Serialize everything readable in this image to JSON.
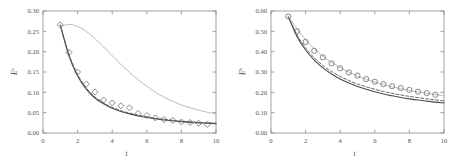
{
  "figure": {
    "background": "#ffffff",
    "panel_count": 2
  },
  "chart_data": [
    {
      "type": "line",
      "panel": "left",
      "title": "",
      "xlabel": "t",
      "ylabel": "E",
      "ylabel_superscript": "u",
      "xlim": [
        0,
        10
      ],
      "ylim": [
        0.0,
        0.3
      ],
      "xticks": [
        0,
        2,
        4,
        6,
        8,
        10
      ],
      "xticklabels": [
        "0",
        "2",
        "4",
        "6",
        "8",
        "10"
      ],
      "yticks": [
        0.0,
        0.05,
        0.1,
        0.15,
        0.2,
        0.25,
        0.3
      ],
      "yticklabels": [
        "0.00",
        "0.05",
        "0.10",
        "0.15",
        "0.20",
        "0.25",
        "0.30"
      ],
      "grid": false,
      "legend": "none",
      "x": [
        1.0,
        1.5,
        2.0,
        2.5,
        3.0,
        3.5,
        4.0,
        4.5,
        5.0,
        5.5,
        6.0,
        6.5,
        7.0,
        7.5,
        8.0,
        8.5,
        9.0,
        9.5,
        10.0
      ],
      "series": [
        {
          "name": "solid-dark-curve",
          "style": "solid",
          "color": "#4d4d4d",
          "width": 1.1,
          "values": [
            0.265,
            0.19,
            0.14,
            0.108,
            0.086,
            0.072,
            0.061,
            0.053,
            0.047,
            0.042,
            0.038,
            0.035,
            0.032,
            0.03,
            0.028,
            0.026,
            0.025,
            0.024,
            0.023
          ]
        },
        {
          "name": "dashed-curve",
          "style": "dashed",
          "color": "#555555",
          "width": 0.9,
          "values": [
            0.266,
            0.194,
            0.144,
            0.111,
            0.089,
            0.074,
            0.063,
            0.055,
            0.049,
            0.044,
            0.04,
            0.036,
            0.034,
            0.031,
            0.029,
            0.028,
            0.026,
            0.025,
            0.024
          ]
        },
        {
          "name": "light-gray-curve",
          "style": "solid",
          "color": "#b3b3b3",
          "width": 0.9,
          "values": [
            0.262,
            0.267,
            0.262,
            0.25,
            0.232,
            0.212,
            0.19,
            0.169,
            0.149,
            0.131,
            0.115,
            0.1,
            0.088,
            0.078,
            0.069,
            0.062,
            0.056,
            0.051,
            0.047
          ]
        }
      ],
      "markers": {
        "name": "diamond-markers",
        "shape": "diamond",
        "color": "#5a5a5a",
        "size": 3.0,
        "x": [
          1.0,
          1.5,
          2.0,
          2.5,
          3.0,
          3.5,
          4.0,
          4.5,
          5.0,
          5.5,
          6.0,
          6.5,
          7.0,
          7.5,
          8.0,
          8.5,
          9.0,
          9.5
        ],
        "values": [
          0.266,
          0.198,
          0.15,
          0.12,
          0.101,
          0.081,
          0.074,
          0.067,
          0.062,
          0.048,
          0.043,
          0.037,
          0.033,
          0.031,
          0.027,
          0.026,
          0.024,
          0.021
        ]
      }
    },
    {
      "type": "line",
      "panel": "right",
      "title": "",
      "xlabel": "t",
      "ylabel": "E",
      "ylabel_superscript": "b",
      "xlim": [
        0,
        10
      ],
      "ylim": [
        0.0,
        0.6
      ],
      "xticks": [
        0,
        2,
        4,
        6,
        8,
        10
      ],
      "xticklabels": [
        "0",
        "2",
        "4",
        "6",
        "8",
        "10"
      ],
      "yticks": [
        0.0,
        0.1,
        0.2,
        0.3,
        0.4,
        0.5,
        0.6
      ],
      "yticklabels": [
        "0.00",
        "0.10",
        "0.20",
        "0.30",
        "0.40",
        "0.50",
        "0.60"
      ],
      "grid": false,
      "legend": "none",
      "x": [
        1.0,
        1.5,
        2.0,
        2.5,
        3.0,
        3.5,
        4.0,
        4.5,
        5.0,
        5.5,
        6.0,
        6.5,
        7.0,
        7.5,
        8.0,
        8.5,
        9.0,
        9.5,
        10.0
      ],
      "series": [
        {
          "name": "solid-dark-curve",
          "style": "solid",
          "color": "#4d4d4d",
          "width": 1.1,
          "values": [
            0.572,
            0.475,
            0.408,
            0.358,
            0.32,
            0.29,
            0.266,
            0.246,
            0.229,
            0.215,
            0.203,
            0.192,
            0.183,
            0.175,
            0.168,
            0.162,
            0.157,
            0.152,
            0.148
          ]
        },
        {
          "name": "dashed-curve",
          "style": "dashed",
          "color": "#555555",
          "width": 0.9,
          "values": [
            0.574,
            0.484,
            0.419,
            0.37,
            0.332,
            0.302,
            0.278,
            0.258,
            0.241,
            0.227,
            0.215,
            0.204,
            0.195,
            0.187,
            0.18,
            0.174,
            0.168,
            0.163,
            0.158
          ]
        },
        {
          "name": "light-gray-curve",
          "style": "solid",
          "color": "#b3b3b3",
          "width": 0.9,
          "values": [
            0.573,
            0.512,
            0.459,
            0.415,
            0.378,
            0.347,
            0.321,
            0.299,
            0.28,
            0.264,
            0.25,
            0.238,
            0.227,
            0.218,
            0.209,
            0.202,
            0.195,
            0.189,
            0.183
          ]
        }
      ],
      "markers": {
        "name": "circle-markers",
        "shape": "circle",
        "color": "#5a5a5a",
        "size": 2.6,
        "x": [
          1.0,
          1.5,
          2.0,
          2.5,
          3.0,
          3.5,
          4.0,
          4.5,
          5.0,
          5.5,
          6.0,
          6.5,
          7.0,
          7.5,
          8.0,
          8.5,
          9.0,
          9.5
        ],
        "values": [
          0.573,
          0.5,
          0.448,
          0.404,
          0.372,
          0.342,
          0.318,
          0.298,
          0.282,
          0.265,
          0.252,
          0.24,
          0.23,
          0.221,
          0.212,
          0.203,
          0.196,
          0.188
        ]
      }
    }
  ]
}
